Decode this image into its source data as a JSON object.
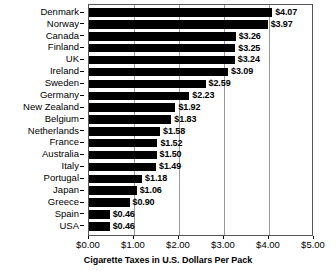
{
  "chart_data": {
    "type": "bar",
    "orientation": "horizontal",
    "title": "",
    "xlabel": "Cigarette Taxes in U.S. Dollars Per Pack",
    "ylabel": "",
    "xlim": [
      0,
      5
    ],
    "xticks": [
      0,
      1,
      2,
      3,
      4,
      5
    ],
    "xtick_labels": [
      "$0.00",
      "$1.00",
      "$2.00",
      "$3.00",
      "$4.00",
      "$5.00"
    ],
    "grid": true,
    "legend": null,
    "value_label_format": "$0.00",
    "bar_color": "#000000",
    "categories": [
      "Denmark",
      "Norway",
      "Canada",
      "Finland",
      "UK",
      "Ireland",
      "Sweden",
      "Germany",
      "New Zealand",
      "Belgium",
      "Netherlands",
      "France",
      "Australia",
      "Italy",
      "Portugal",
      "Japan",
      "Greece",
      "Spain",
      "USA"
    ],
    "values": [
      4.07,
      3.97,
      3.26,
      3.25,
      3.24,
      3.09,
      2.59,
      2.23,
      1.92,
      1.83,
      1.58,
      1.52,
      1.5,
      1.49,
      1.18,
      1.06,
      0.9,
      0.46,
      0.46
    ],
    "value_labels": [
      "$4.07",
      "$3.97",
      "$3.26",
      "$3.25",
      "$3.24",
      "$3.09",
      "$2.59",
      "$2.23",
      "$1.92",
      "$1.83",
      "$1.58",
      "$1.52",
      "$1.50",
      "$1.49",
      "$1.18",
      "$1.06",
      "$0.90",
      "$0.46",
      "$0.46"
    ]
  }
}
